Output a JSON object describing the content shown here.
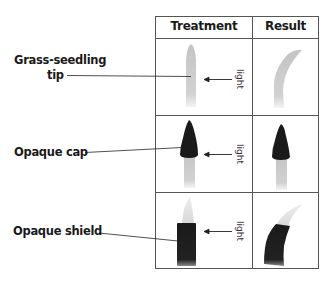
{
  "table": {
    "headers": [
      "Treatment",
      "Result"
    ],
    "rows": [
      {
        "label_line1": "Grass-seedling",
        "label_line2": "tip",
        "light_label": "light",
        "treatment": "uncovered tip, light from the right",
        "result": "tip bends toward light"
      },
      {
        "label_line1": "Opaque cap",
        "light_label": "light",
        "treatment": "tip covered by opaque cap",
        "result": "no bending"
      },
      {
        "label_line1": "Opaque shield",
        "light_label": "light",
        "treatment": "base covered by opaque shield, tip exposed",
        "result": "bends toward light"
      }
    ]
  },
  "colors": {
    "grid": "#555555",
    "seedling": "#c8c8c8",
    "opaque": "#1a1a1a"
  }
}
